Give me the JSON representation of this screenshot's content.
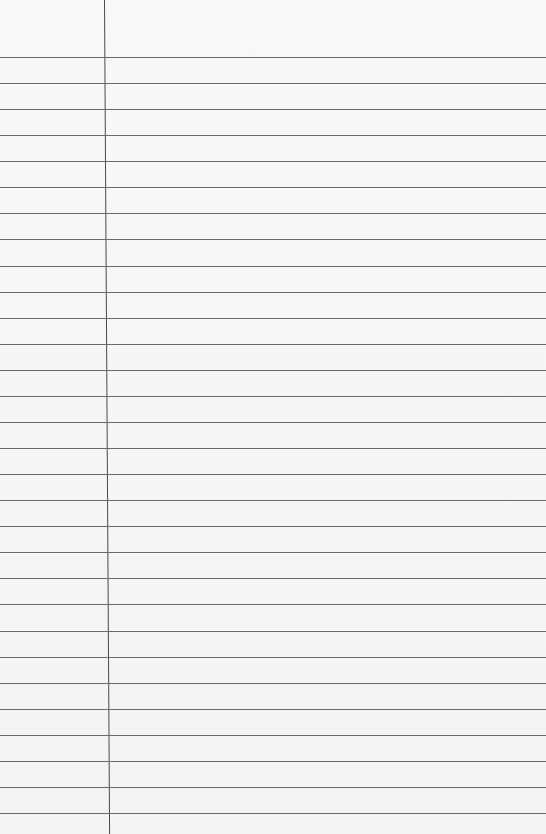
{
  "paper": {
    "type": "lined-notebook-paper",
    "background_color": "#f6f6f6",
    "line_color": "#6a6a6a",
    "margin_line_color": "#4a4a4a",
    "first_line_y": 57,
    "line_spacing": 26.07,
    "line_count": 30,
    "margin_x_top": 106,
    "margin_x_bottom": 101
  }
}
